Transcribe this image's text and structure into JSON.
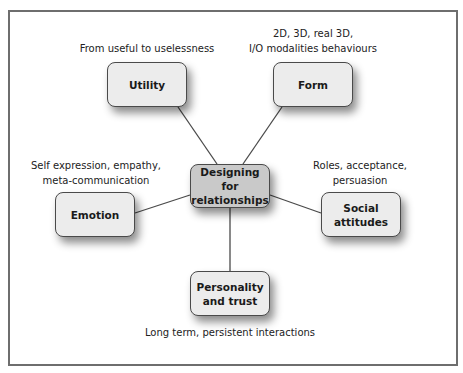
{
  "diagram": {
    "center": {
      "label_line1": "Designing for",
      "label_line2": "relationships"
    },
    "nodes": [
      {
        "id": "utility",
        "label_line1": "Utility",
        "label_line2": "",
        "description_line1": "From useful to uselessness",
        "description_line2": ""
      },
      {
        "id": "form",
        "label_line1": "Form",
        "label_line2": "",
        "description_line1": "2D, 3D, real 3D,",
        "description_line2": "I/O modalities behaviours"
      },
      {
        "id": "emotion",
        "label_line1": "Emotion",
        "label_line2": "",
        "description_line1": "Self expression, empathy,",
        "description_line2": "meta-communication"
      },
      {
        "id": "social-attitudes",
        "label_line1": "Social",
        "label_line2": "attitudes",
        "description_line1": "Roles, acceptance,",
        "description_line2": "persuasion"
      },
      {
        "id": "personality-trust",
        "label_line1": "Personality",
        "label_line2": "and trust",
        "description_line1": "Long term, persistent interactions",
        "description_line2": ""
      }
    ],
    "colors": {
      "frame_border": "#6e6e6e",
      "node_fill": "#ececec",
      "center_fill": "#c9c9c9",
      "node_border": "#4a4a4a",
      "connector": "#4a4a4a"
    }
  }
}
